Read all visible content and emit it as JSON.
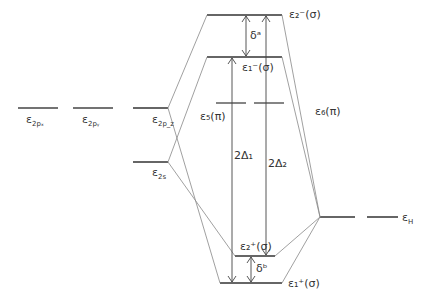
{
  "diagram": {
    "levels": {
      "e2px": {
        "label": "ε",
        "sub": "2pₓ"
      },
      "e2py": {
        "label": "ε",
        "sub": "2pᵧ"
      },
      "e2pz": {
        "label": "ε",
        "sub": "2p_z"
      },
      "e2s": {
        "label": "ε",
        "sub": "2s"
      },
      "e5pi": {
        "label": "ε₅(π)"
      },
      "e6pi": {
        "label": "ε₆(π)"
      },
      "e2minus": {
        "label": "ε₂⁻(σ)"
      },
      "e1minus": {
        "label": "ε₁⁻(σ)"
      },
      "e2plus": {
        "label": "ε₂⁺(σ)"
      },
      "e1plus": {
        "label": "ε₁⁺(σ)"
      },
      "eH": {
        "label": "ε",
        "sub": "H"
      }
    },
    "annotations": {
      "delta_a": "δᵃ",
      "delta_b": "δᵇ",
      "two_delta_1": "2Δ₁",
      "two_delta_2": "2Δ₂"
    },
    "colors": {
      "level": "#333333",
      "connector": "#888888",
      "arrow": "#444444"
    }
  }
}
